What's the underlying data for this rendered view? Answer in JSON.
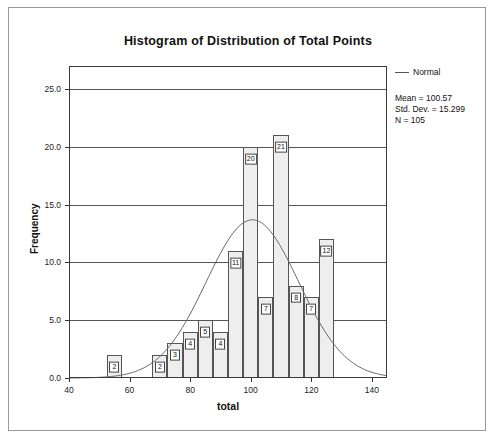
{
  "chart_data": {
    "type": "bar",
    "title": "Histogram of Distribution of Total Points",
    "xlabel": "total",
    "ylabel": "Frequency",
    "xlim": [
      40,
      145
    ],
    "ylim": [
      0,
      27
    ],
    "xticks": [
      "40",
      "60",
      "80",
      "100",
      "120",
      "140"
    ],
    "xtick_values": [
      40,
      60,
      80,
      100,
      120,
      140
    ],
    "yticks": [
      "0.0",
      "5.0",
      "10.0",
      "15.0",
      "20.0",
      "25.0"
    ],
    "ytick_values": [
      0,
      5,
      10,
      15,
      20,
      25
    ],
    "grid": true,
    "bin_width": 5,
    "bins": [
      {
        "start": 52.5,
        "end": 57.5,
        "value": 2,
        "label": "2"
      },
      {
        "start": 67.5,
        "end": 72.5,
        "value": 2,
        "label": "2"
      },
      {
        "start": 72.5,
        "end": 77.5,
        "value": 3,
        "label": "3"
      },
      {
        "start": 77.5,
        "end": 82.5,
        "value": 4,
        "label": "4"
      },
      {
        "start": 82.5,
        "end": 87.5,
        "value": 5,
        "label": "5"
      },
      {
        "start": 87.5,
        "end": 92.5,
        "value": 4,
        "label": "4"
      },
      {
        "start": 92.5,
        "end": 97.5,
        "value": 11,
        "label": "11"
      },
      {
        "start": 97.5,
        "end": 102.5,
        "value": 20,
        "label": "20"
      },
      {
        "start": 102.5,
        "end": 107.5,
        "value": 7,
        "label": "7"
      },
      {
        "start": 107.5,
        "end": 112.5,
        "value": 21,
        "label": "21"
      },
      {
        "start": 112.5,
        "end": 117.5,
        "value": 8,
        "label": "8"
      },
      {
        "start": 117.5,
        "end": 122.5,
        "value": 7,
        "label": "7"
      },
      {
        "start": 122.5,
        "end": 127.5,
        "value": 12,
        "label": "12"
      }
    ],
    "legend": {
      "position": "top-right",
      "entries": [
        "Normal"
      ]
    },
    "normal_curve": {
      "mean": 100.57,
      "std_dev": 15.299,
      "n": 105
    },
    "annotations": [
      "Mean = 100.57",
      "Std. Dev. = 15.299",
      "N = 105"
    ]
  },
  "legend": {
    "normal_label": "Normal"
  },
  "stats": {
    "mean": "Mean = 100.57",
    "std_dev": "Std. Dev. = 15.299",
    "n": "N = 105"
  }
}
